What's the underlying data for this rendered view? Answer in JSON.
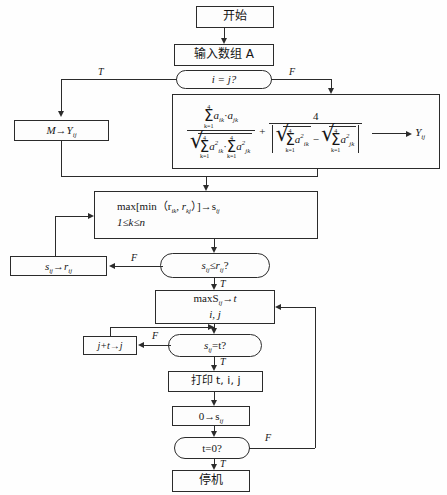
{
  "diagram": {
    "nodes": {
      "start": {
        "label": "开始",
        "shape": "terminator"
      },
      "input": {
        "label": "输入数组 A",
        "shape": "process"
      },
      "decide_ij": {
        "label": "i = j?",
        "shape": "decision"
      },
      "assign_m": {
        "label": "M→Y",
        "sub": "ij",
        "shape": "process"
      },
      "formula": {
        "shape": "process",
        "numerator_sum": {
          "upper": "4",
          "lower": "k=1",
          "body": "a",
          "sub1": "ik",
          "dot": "·",
          "body2": "a",
          "sub2": "jk"
        },
        "denominator_left": {
          "upper": "4",
          "lower": "k=1",
          "sub1": "ik",
          "sub2": "jk"
        },
        "right_numerator": "4",
        "output": "Y",
        "output_sub": "ij"
      },
      "maxmin": {
        "line1": "max[min（r",
        "line1_sub1": "ik",
        "line1_mid": ", r",
        "line1_sub2": "kj",
        "line1_end": "）]→s",
        "line1_sub3": "ij",
        "line2": "1≤k≤n",
        "shape": "process"
      },
      "decide_sr": {
        "label": "s",
        "sub1": "ij",
        "mid": "≤r",
        "sub2": "ij",
        "end": "?",
        "shape": "decision"
      },
      "assign_sr": {
        "label": "s",
        "sub1": "ij",
        "mid": "→r",
        "sub2": "ij",
        "shape": "process"
      },
      "maxs": {
        "line1": "maxS",
        "line1_sub": "ij",
        "line1_end": "→t",
        "line2": "i, j",
        "shape": "process"
      },
      "decide_st": {
        "label": "s",
        "sub1": "ij",
        "end": "=t?",
        "shape": "decision"
      },
      "assign_jt": {
        "label": "j+t→j",
        "shape": "process"
      },
      "print": {
        "label": "打印 t, i, j",
        "shape": "process"
      },
      "zero_s": {
        "label": "0→s",
        "sub": "ij",
        "shape": "process"
      },
      "decide_t0": {
        "label": "t=0?",
        "shape": "decision"
      },
      "stop": {
        "label": "停机",
        "shape": "terminator"
      }
    },
    "edge_labels": {
      "ij_true": "T",
      "ij_false": "F",
      "sr_false": "F",
      "sr_true": "T",
      "st_false": "F",
      "st_true": "T",
      "t0_false": "F",
      "t0_true": "T"
    },
    "colors": {
      "stroke": "#2b2b2b",
      "fill": "#fdfdfd",
      "background": "#fefefe",
      "text": "#151515"
    }
  }
}
